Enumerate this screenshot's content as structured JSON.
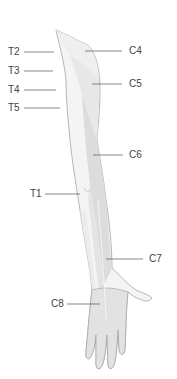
{
  "colors": {
    "outline": "#9a9a9a",
    "zone_light": "#f3f3f3",
    "zone_mid": "#e6e6e6",
    "zone_dark": "#d9d9d9",
    "leader": "#555555",
    "text": "#444444"
  },
  "labels_left": [
    {
      "id": "T2",
      "text": "T2"
    },
    {
      "id": "T3",
      "text": "T3"
    },
    {
      "id": "T4",
      "text": "T4"
    },
    {
      "id": "T5",
      "text": "T5"
    },
    {
      "id": "T1",
      "text": "T1"
    },
    {
      "id": "C8",
      "text": "C8"
    }
  ],
  "labels_right": [
    {
      "id": "C4",
      "text": "C4"
    },
    {
      "id": "C5",
      "text": "C5"
    },
    {
      "id": "C6",
      "text": "C6"
    },
    {
      "id": "C7",
      "text": "C7"
    }
  ]
}
